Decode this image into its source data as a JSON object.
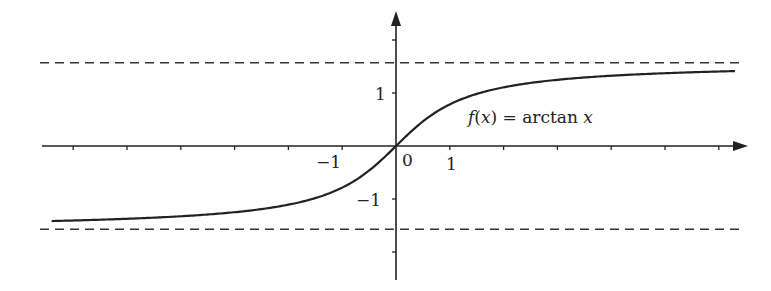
{
  "chart_data": {
    "type": "line",
    "title": "",
    "function_label": "f(x) = arctan x",
    "function_label_parts": {
      "f": "f",
      "lp": "(",
      "x": "x",
      "rp": ")",
      "eq": " = arctan ",
      "x2": "x"
    },
    "xlabel": "",
    "ylabel": "",
    "xlim": [
      -6.4,
      6.3
    ],
    "ylim": [
      -2.5,
      2.5
    ],
    "x_tick_labels": [
      "-1",
      "0",
      "1"
    ],
    "y_tick_labels": [
      "1",
      "-1"
    ],
    "x_ticks": [
      -6,
      -5,
      -4,
      -3,
      -2,
      -1,
      1,
      2,
      3,
      4,
      5,
      6
    ],
    "y_ticks": [
      -2,
      -1,
      1,
      2
    ],
    "asymptotes": [
      {
        "y": 1.5708,
        "style": "dashed"
      },
      {
        "y": -1.5708,
        "style": "dashed"
      }
    ],
    "series": [
      {
        "name": "arctan x",
        "x_range": [
          -6.4,
          6.3
        ]
      }
    ],
    "grid": false,
    "legend": "none"
  },
  "labels": {
    "xm1": "−1",
    "x0": "0",
    "x1": "1",
    "y1": "1",
    "ym1": "−1"
  }
}
